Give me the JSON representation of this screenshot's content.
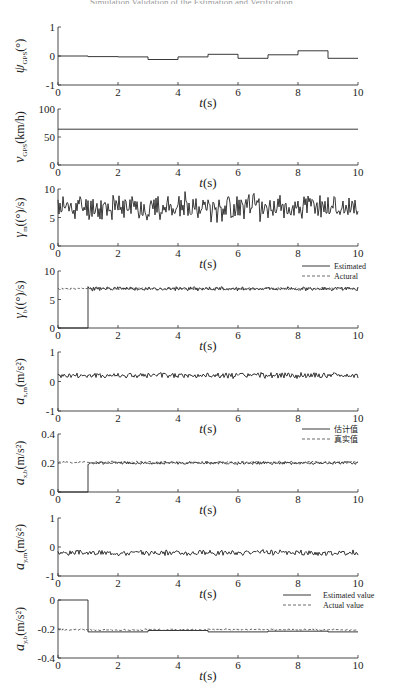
{
  "figure": {
    "header_text": "Simulation Validation of the Estimation and Verification"
  },
  "chart_data": [
    {
      "type": "line",
      "id": "psi_gps",
      "ylabel": "ψ_GPS(°)",
      "ylabel_main": "ψ",
      "ylabel_sub": "GPS",
      "ylabel_unit": "(°)",
      "xlabel": "t(s)",
      "xlim": [
        0,
        10
      ],
      "ylim": [
        -1,
        1
      ],
      "xticks": [
        0,
        2,
        4,
        6,
        8,
        10
      ],
      "yticks": [
        -1,
        0,
        1
      ],
      "style": "step",
      "series": [
        {
          "name": "psi_GPS",
          "x": [
            0,
            1,
            2,
            3,
            4,
            5,
            6,
            7,
            8,
            9,
            10
          ],
          "values": [
            0.0,
            -0.02,
            -0.03,
            -0.12,
            -0.03,
            0.06,
            -0.08,
            0.04,
            0.18,
            -0.08,
            -0.08
          ]
        }
      ]
    },
    {
      "type": "line",
      "id": "v_gps",
      "ylabel": "v_GPS(km/h)",
      "ylabel_main": "v",
      "ylabel_sub": "GPS",
      "ylabel_unit": "(km/h)",
      "xlabel": "t(s)",
      "xlim": [
        0,
        10
      ],
      "ylim": [
        0,
        100
      ],
      "xticks": [
        0,
        2,
        4,
        6,
        8,
        10
      ],
      "yticks": [
        0,
        50,
        100
      ],
      "style": "constant",
      "series": [
        {
          "name": "v_GPS",
          "x": [
            0,
            10
          ],
          "values": [
            64,
            64
          ]
        }
      ]
    },
    {
      "type": "line",
      "id": "gamma_m",
      "ylabel": "γ_m((°)/s)",
      "ylabel_main": "γ",
      "ylabel_sub": "m",
      "ylabel_unit": "((°)/s)",
      "xlabel": "t(s)",
      "xlim": [
        0,
        10
      ],
      "ylim": [
        0,
        10
      ],
      "xticks": [
        0,
        2,
        4,
        6,
        8,
        10
      ],
      "yticks": [
        0,
        5,
        10
      ],
      "style": "noise",
      "series": [
        {
          "name": "gamma_m",
          "mean": 6.8,
          "amplitude": 2.8,
          "x_start": 0,
          "x_end": 10,
          "seed": 11
        }
      ]
    },
    {
      "type": "line",
      "id": "gamma_b",
      "ylabel": "γ_b((°)/s)",
      "ylabel_main": "γ",
      "ylabel_sub": "b",
      "ylabel_unit": "((°)/s)",
      "xlabel": "t(s)",
      "xlim": [
        0,
        10
      ],
      "ylim": [
        0,
        10
      ],
      "xticks": [
        0,
        2,
        4,
        6,
        8,
        10
      ],
      "yticks": [
        0,
        5,
        10
      ],
      "legend": [
        "Estimated",
        "Actural"
      ],
      "legend_position": "top-right",
      "style": "estimate",
      "series": [
        {
          "name": "Estimated",
          "kind": "solid",
          "initial": 0,
          "switch_x": 1,
          "mean": 6.9,
          "amplitude": 0.45,
          "seed": 23
        },
        {
          "name": "Actural",
          "kind": "dashed",
          "mean": 6.9,
          "amplitude": 0.25,
          "seed": 31
        }
      ]
    },
    {
      "type": "line",
      "id": "a_x_m",
      "ylabel": "a_x,m(m/s²)",
      "ylabel_main": "a",
      "ylabel_sub": "x,m",
      "ylabel_unit": "(m/s²)",
      "xlabel": "t(s)",
      "xlim": [
        0,
        10
      ],
      "ylim": [
        -1,
        1
      ],
      "xticks": [
        0,
        2,
        4,
        6,
        8,
        10
      ],
      "yticks": [
        -1,
        0,
        1
      ],
      "style": "noise",
      "series": [
        {
          "name": "a_x_m",
          "mean": 0.2,
          "amplitude": 0.12,
          "x_start": 0,
          "x_end": 10,
          "seed": 41
        }
      ]
    },
    {
      "type": "line",
      "id": "a_x_b",
      "ylabel": "a_x,b(m/s²)",
      "ylabel_main": "a",
      "ylabel_sub": "x,b",
      "ylabel_unit": "(m/s²)",
      "xlabel": "t(s)",
      "xlim": [
        0,
        10
      ],
      "ylim": [
        0,
        0.4
      ],
      "xticks": [
        0,
        2,
        4,
        6,
        8,
        10
      ],
      "yticks": [
        0,
        0.2,
        0.4
      ],
      "legend": [
        "估计值",
        "真实值"
      ],
      "legend_position": "top-right",
      "style": "estimate",
      "series": [
        {
          "name": "估计值",
          "kind": "solid",
          "initial": 0,
          "switch_x": 1,
          "mean": 0.2,
          "amplitude": 0.012,
          "seed": 53
        },
        {
          "name": "真实值",
          "kind": "dashed",
          "mean": 0.205,
          "amplitude": 0.01,
          "seed": 59
        }
      ]
    },
    {
      "type": "line",
      "id": "a_y_m",
      "ylabel": "a_y,m(m/s²)",
      "ylabel_main": "a",
      "ylabel_sub": "y,m",
      "ylabel_unit": "(m/s²)",
      "xlabel": "t(s)",
      "xlim": [
        0,
        10
      ],
      "ylim": [
        -1,
        1
      ],
      "xticks": [
        0,
        2,
        4,
        6,
        8,
        10
      ],
      "yticks": [
        -1,
        0,
        1
      ],
      "style": "noise",
      "series": [
        {
          "name": "a_y_m",
          "mean": -0.2,
          "amplitude": 0.12,
          "x_start": 0,
          "x_end": 10,
          "seed": 67
        }
      ]
    },
    {
      "type": "line",
      "id": "a_y_b",
      "ylabel": "a_y,b(m/s²)",
      "ylabel_main": "a",
      "ylabel_sub": "y,b",
      "ylabel_unit": "(m/s²)",
      "xlabel": "t(s)",
      "xlim": [
        0,
        10
      ],
      "ylim": [
        -0.4,
        0
      ],
      "xticks": [
        0,
        2,
        4,
        6,
        8,
        10
      ],
      "yticks": [
        -0.4,
        -0.2,
        0
      ],
      "legend": [
        "Estimated value",
        "Actual value"
      ],
      "legend_position": "top-right",
      "style": "estimate-step",
      "series": [
        {
          "name": "Estimated value",
          "kind": "solid",
          "x": [
            0,
            1,
            3,
            5,
            7,
            9,
            10
          ],
          "values": [
            0,
            -0.22,
            -0.21,
            -0.22,
            -0.215,
            -0.22,
            -0.22
          ]
        },
        {
          "name": "Actual value",
          "kind": "dashed",
          "mean": -0.205,
          "amplitude": 0.008,
          "seed": 79
        }
      ]
    }
  ]
}
